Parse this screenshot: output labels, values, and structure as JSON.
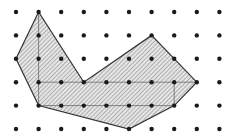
{
  "diagram": {
    "type": "dot-grid-polygon",
    "grid": {
      "columns": 10,
      "rows": 6,
      "x": [
        16,
        38.6,
        61.2,
        83.8,
        106.4,
        129,
        151.6,
        174.2,
        196.8,
        219.4
      ],
      "y": [
        12,
        35.4,
        58.8,
        82.2,
        105.6,
        129
      ],
      "dot_color": "#1a1a1a"
    },
    "polygon": {
      "vertices_grid": [
        [
          1,
          0
        ],
        [
          0,
          2
        ],
        [
          1,
          4
        ],
        [
          5,
          5
        ],
        [
          7,
          4
        ],
        [
          8,
          3
        ],
        [
          6,
          1
        ],
        [
          3,
          3
        ]
      ],
      "fill": "hatched",
      "stroke_color": "#333333",
      "hatch_color": "#8a8a8a"
    },
    "inner_lines_grid": [
      [
        [
          1,
          0
        ],
        [
          1,
          4
        ]
      ],
      [
        [
          1,
          3
        ],
        [
          8,
          3
        ]
      ],
      [
        [
          1,
          4
        ],
        [
          7,
          4
        ]
      ],
      [
        [
          7,
          3
        ],
        [
          7,
          4
        ]
      ]
    ]
  }
}
